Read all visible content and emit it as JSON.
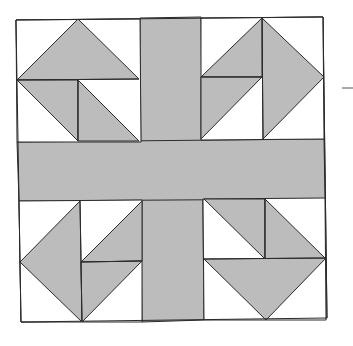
{
  "diagram": {
    "type": "quilt-block",
    "colors": {
      "fill": "#bcbcbc",
      "background": "#ffffff",
      "stroke": "#2a2a2a"
    },
    "block": {
      "outline": [
        [
          16,
          20
        ],
        [
          323,
          17
        ],
        [
          327,
          318
        ],
        [
          21,
          322
        ]
      ]
    },
    "cross": {
      "vertical_band": [
        [
          140,
          18
        ],
        [
          201,
          17
        ],
        [
          204,
          320
        ],
        [
          142,
          322
        ]
      ],
      "horizontal_band": [
        [
          17,
          142
        ],
        [
          324,
          139
        ],
        [
          325,
          199
        ],
        [
          19,
          201
        ]
      ]
    },
    "corners": [
      {
        "name": "top-left",
        "square": [
          [
            16,
            20
          ],
          [
            140,
            19
          ],
          [
            141,
            142
          ],
          [
            17,
            142
          ]
        ],
        "shaded": [
          [
            [
              78,
              19
            ],
            [
              139,
              79
            ],
            [
              17,
              80
            ]
          ],
          [
            [
              17,
              80
            ],
            [
              78,
              80
            ],
            [
              78,
              141
            ]
          ],
          [
            [
              78,
              80
            ],
            [
              139,
              141
            ],
            [
              78,
              141
            ]
          ]
        ],
        "lines": [
          [
            [
              17,
              80
            ],
            [
              139,
              79
            ]
          ],
          [
            [
              78,
              80
            ],
            [
              78,
              141
            ]
          ]
        ]
      },
      {
        "name": "top-right",
        "square": [
          [
            201,
            18
          ],
          [
            323,
            17
          ],
          [
            324,
            139
          ],
          [
            201,
            140
          ]
        ],
        "shaded": [
          [
            [
              262,
              18
            ],
            [
              324,
              77
            ],
            [
              263,
              139
            ]
          ],
          [
            [
              201,
              77
            ],
            [
              262,
              18
            ],
            [
              262,
              77
            ]
          ],
          [
            [
              201,
              77
            ],
            [
              262,
              77
            ],
            [
              201,
              139
            ]
          ]
        ],
        "lines": [
          [
            [
              262,
              18
            ],
            [
              263,
              139
            ]
          ],
          [
            [
              201,
              77
            ],
            [
              262,
              77
            ]
          ]
        ]
      },
      {
        "name": "bottom-left",
        "square": [
          [
            19,
            201
          ],
          [
            142,
            200
          ],
          [
            142,
            322
          ],
          [
            21,
            322
          ]
        ],
        "shaded": [
          [
            [
              80,
              201
            ],
            [
              20,
              262
            ],
            [
              82,
              322
            ]
          ],
          [
            [
              81,
              262
            ],
            [
              142,
              201
            ],
            [
              142,
              261
            ]
          ],
          [
            [
              81,
              262
            ],
            [
              142,
              261
            ],
            [
              82,
              322
            ]
          ]
        ],
        "lines": [
          [
            [
              80,
              201
            ],
            [
              82,
              322
            ]
          ],
          [
            [
              81,
              262
            ],
            [
              142,
              261
            ]
          ]
        ]
      },
      {
        "name": "bottom-right",
        "square": [
          [
            203,
            199
          ],
          [
            325,
            198
          ],
          [
            326,
            320
          ],
          [
            204,
            320
          ]
        ],
        "shaded": [
          [
            [
              204,
              199
            ],
            [
              265,
              199
            ],
            [
              265,
              259
            ]
          ],
          [
            [
              265,
              199
            ],
            [
              326,
              259
            ],
            [
              265,
              259
            ]
          ],
          [
            [
              204,
              259
            ],
            [
              326,
              258
            ],
            [
              266,
              320
            ]
          ]
        ],
        "lines": [
          [
            [
              265,
              199
            ],
            [
              265,
              259
            ]
          ],
          [
            [
              204,
              259
            ],
            [
              326,
              258
            ]
          ]
        ]
      }
    ],
    "side_mark": {
      "x1": 342,
      "y1": 88,
      "x2": 353,
      "y2": 88
    }
  },
  "caption": "· · · · ·"
}
